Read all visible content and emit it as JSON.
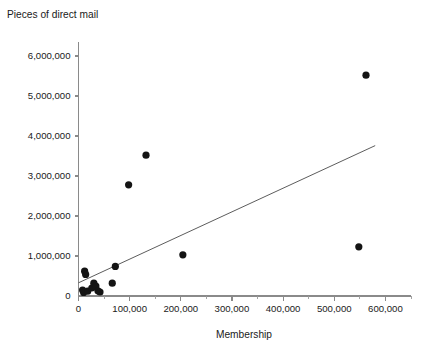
{
  "chart_data": {
    "type": "scatter",
    "title": "",
    "xlabel": "Membership",
    "ylabel": "Pieces of direct mail",
    "xlim": [
      0,
      650000
    ],
    "ylim": [
      0,
      6400000
    ],
    "grid": false,
    "legend": null,
    "x_ticks": [
      0,
      100000,
      200000,
      300000,
      400000,
      500000,
      600000
    ],
    "x_tick_labels": [
      "0",
      "100,000",
      "200,000",
      "300,000",
      "400,000",
      "500,000",
      "600,000"
    ],
    "x_minor_ticks": [
      50000,
      150000,
      250000,
      350000,
      450000,
      550000,
      650000
    ],
    "y_ticks": [
      0,
      1000000,
      2000000,
      3000000,
      4000000,
      5000000,
      6000000
    ],
    "y_tick_labels": [
      "0",
      "1,000,000",
      "2,000,000",
      "3,000,000",
      "4,000,000",
      "5,000,000",
      "6,000,000"
    ],
    "points": [
      {
        "x": 8000,
        "y": 150000
      },
      {
        "x": 10000,
        "y": 90000
      },
      {
        "x": 12000,
        "y": 620000
      },
      {
        "x": 14000,
        "y": 540000
      },
      {
        "x": 18000,
        "y": 120000
      },
      {
        "x": 26000,
        "y": 200000
      },
      {
        "x": 30000,
        "y": 320000
      },
      {
        "x": 34000,
        "y": 250000
      },
      {
        "x": 38000,
        "y": 130000
      },
      {
        "x": 42000,
        "y": 100000
      },
      {
        "x": 66000,
        "y": 320000
      },
      {
        "x": 72000,
        "y": 740000
      },
      {
        "x": 98000,
        "y": 2780000
      },
      {
        "x": 132000,
        "y": 3520000
      },
      {
        "x": 204000,
        "y": 1030000
      },
      {
        "x": 548000,
        "y": 1230000
      },
      {
        "x": 562000,
        "y": 5520000
      }
    ],
    "trend_line": {
      "x_start": 0,
      "y_start": 330000,
      "x_end": 580000,
      "y_end": 3760000
    },
    "marker_radius_px": 3.6,
    "colors": {
      "marker": "#141414",
      "trend": "#4a4a4a",
      "axis": "#8a8a8a",
      "text": "#1a1a1a",
      "background": "#ffffff"
    }
  }
}
